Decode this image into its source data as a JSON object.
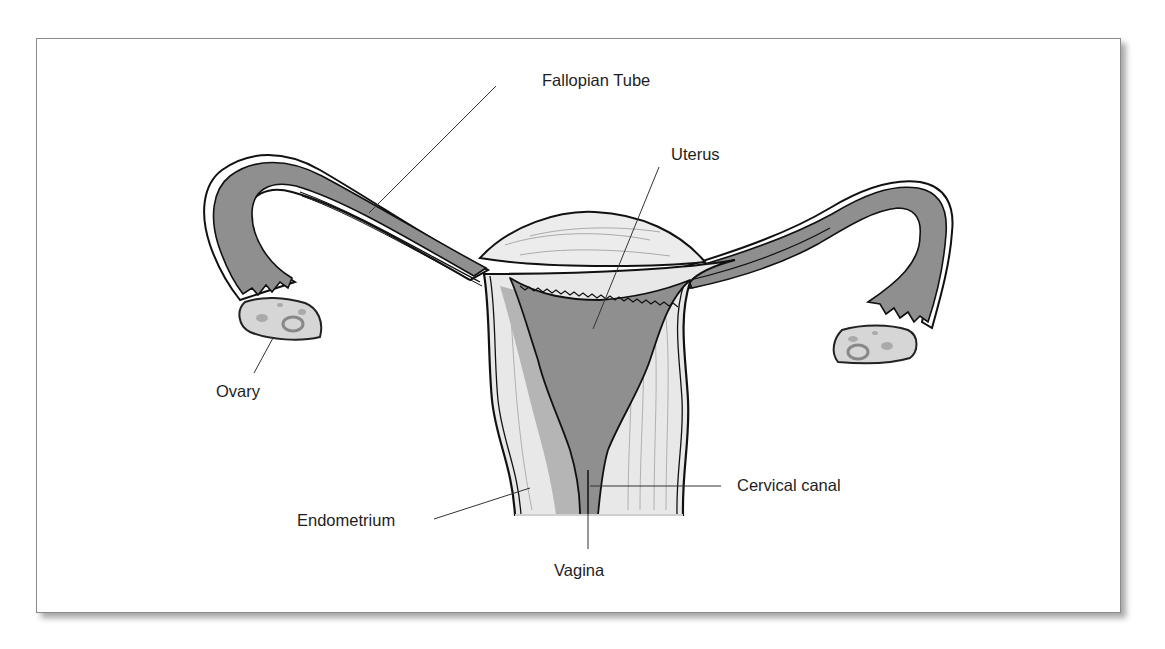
{
  "figure": {
    "labels": {
      "fallopian_tube": "Fallopian Tube",
      "uterus": "Uterus",
      "ovary": "Ovary",
      "cervical_canal": "Cervical canal",
      "endometrium": "Endometrium",
      "vagina": "Vagina"
    },
    "colors": {
      "dark_tissue": "#8f8f8f",
      "light_tissue": "#e6e6e6",
      "medium_tissue": "#b5b5b5",
      "outline": "#111111",
      "leader_line": "#333333",
      "frame_border": "#8a8a8a"
    }
  }
}
